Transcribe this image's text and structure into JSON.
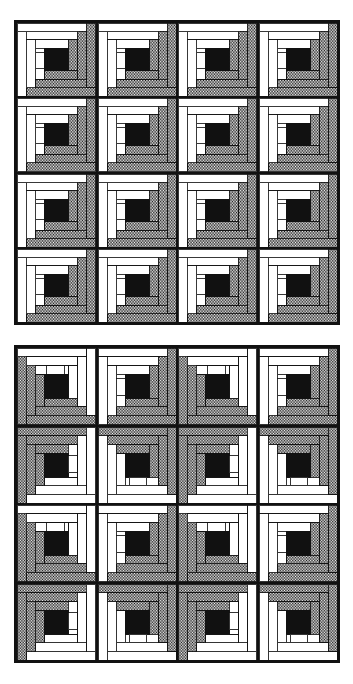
{
  "document": {
    "title": "Log Cabin Quilt Layout Diagrams",
    "figure_count": 2,
    "caption": ""
  },
  "palette": {
    "dark_fabric": "#808080",
    "light_fabric": "#ffffff",
    "center_fabric": "#111111",
    "outline": "#111111",
    "background": "#ffffff"
  },
  "legend": {
    "dark_label": "dark fabric",
    "light_label": "light fabric",
    "center_label": "center square"
  },
  "quilts": [
    {
      "id": "quilt-top",
      "name": "Straight Furrows / All-Same Setting",
      "rows": 4,
      "cols": 4,
      "block_count": 16,
      "setting": "uniform",
      "block_orientation_grid": [
        [
          "light-tl",
          "light-tl",
          "light-tl",
          "light-tl"
        ],
        [
          "light-tl",
          "light-tl",
          "light-tl",
          "light-tl"
        ],
        [
          "light-tl",
          "light-tl",
          "light-tl",
          "light-tl"
        ],
        [
          "light-tl",
          "light-tl",
          "light-tl",
          "light-tl"
        ]
      ]
    },
    {
      "id": "quilt-bottom",
      "name": "Barn Raising / Alternating Setting",
      "rows": 4,
      "cols": 4,
      "block_count": 16,
      "setting": "alternating",
      "block_orientation_grid": [
        [
          "light-bl",
          "light-tl",
          "light-bl",
          "light-tl"
        ],
        [
          "light-br",
          "light-tr",
          "light-br",
          "light-tr"
        ],
        [
          "light-bl",
          "light-tl",
          "light-bl",
          "light-tl"
        ],
        [
          "light-br",
          "light-tr",
          "light-br",
          "light-tr"
        ]
      ]
    }
  ],
  "block_spec": {
    "ring_count": 3,
    "center_size_ratio": 0.16,
    "log_width_ratio": 0.12,
    "description": "Log cabin block: dark logs on one half, light logs on the opposite half, dark center square."
  }
}
